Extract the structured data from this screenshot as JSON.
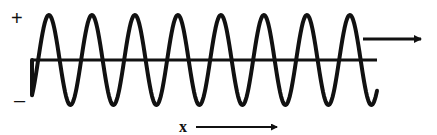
{
  "diagram": {
    "labels": {
      "positive": "+",
      "negative": "–",
      "x_axis": "x"
    },
    "wave": {
      "type": "sine",
      "cycles": 8,
      "start_x": 32,
      "end_x": 377,
      "baseline_y": 60,
      "amplitude_up": 45,
      "amplitude_down": 45,
      "period_px": 43,
      "stroke_color": "#111111",
      "stroke_width": 4
    },
    "axis_line": {
      "x1": 32,
      "x2": 377,
      "y": 60,
      "color": "#111111",
      "width": 3
    },
    "propagation_arrow": {
      "x1": 363,
      "x2": 421,
      "y": 39,
      "color": "#111111"
    },
    "x_arrow": {
      "x1": 196,
      "x2": 277,
      "y": 127,
      "color": "#111111"
    }
  }
}
